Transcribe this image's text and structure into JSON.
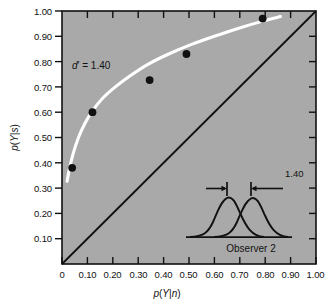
{
  "chart_data": {
    "type": "scatter",
    "title": "",
    "xlabel": "p(Y|n)",
    "ylabel": "p(Y|s)",
    "xlim": [
      0,
      1
    ],
    "ylim": [
      0,
      1
    ],
    "grid": false,
    "legend": "none",
    "xticklabels": [
      "0",
      "0.10",
      "0.20",
      "0.30",
      "0.40",
      "0.50",
      "0.60",
      "0.70",
      "0.80",
      "0.90",
      "1.00"
    ],
    "xtickvalues": [
      0,
      0.1,
      0.2,
      0.3,
      0.4,
      0.5,
      0.6,
      0.7,
      0.8,
      0.9,
      1.0
    ],
    "yticklabels": [
      "0.10",
      "0.20",
      "0.30",
      "0.40",
      "0.50",
      "0.60",
      "0.70",
      "0.80",
      "0.90",
      "1.00"
    ],
    "ytickvalues": [
      0.1,
      0.2,
      0.3,
      0.4,
      0.5,
      0.6,
      0.7,
      0.8,
      0.9,
      1.0
    ],
    "series": [
      {
        "name": "data-points",
        "marker": "filled-circle",
        "color": "#111111",
        "points": [
          {
            "x": 0.04,
            "y": 0.38
          },
          {
            "x": 0.12,
            "y": 0.6
          },
          {
            "x": 0.345,
            "y": 0.727
          },
          {
            "x": 0.49,
            "y": 0.83
          },
          {
            "x": 0.79,
            "y": 0.97
          }
        ]
      },
      {
        "name": "roc-curve",
        "marker": "line",
        "color": "#ffffff",
        "annotation": "d' = 1.40",
        "points": [
          {
            "x": 0.02,
            "y": 0.327
          },
          {
            "x": 0.03,
            "y": 0.38
          },
          {
            "x": 0.045,
            "y": 0.44
          },
          {
            "x": 0.065,
            "y": 0.5
          },
          {
            "x": 0.09,
            "y": 0.555
          },
          {
            "x": 0.12,
            "y": 0.605
          },
          {
            "x": 0.16,
            "y": 0.655
          },
          {
            "x": 0.21,
            "y": 0.7
          },
          {
            "x": 0.27,
            "y": 0.745
          },
          {
            "x": 0.34,
            "y": 0.79
          },
          {
            "x": 0.42,
            "y": 0.83
          },
          {
            "x": 0.51,
            "y": 0.868
          },
          {
            "x": 0.6,
            "y": 0.9
          },
          {
            "x": 0.69,
            "y": 0.93
          },
          {
            "x": 0.78,
            "y": 0.957
          },
          {
            "x": 0.86,
            "y": 0.978
          }
        ]
      },
      {
        "name": "chance-diagonal",
        "marker": "line",
        "color": "#111111",
        "points": [
          {
            "x": 0.0,
            "y": 0.0
          },
          {
            "x": 1.0,
            "y": 1.0
          }
        ]
      }
    ],
    "annotations": [
      {
        "name": "dprime-label",
        "text": "d′ = 1.40",
        "x": 0.08,
        "y": 0.795
      },
      {
        "name": "inset-separation-value",
        "text": "1.40"
      },
      {
        "name": "inset-caption",
        "text": "Observer 2"
      }
    ],
    "plot_background_color": "#a9a9a9",
    "curve_color": "#ffffff",
    "marker_color": "#111111",
    "axis_color": "#111111"
  },
  "axes": {
    "x_title_parts": {
      "p": "p(",
      "Y": "Y",
      "bar": "|",
      "n": "n",
      "close": ")"
    },
    "y_title_parts": {
      "p": "p(",
      "Y": "Y",
      "bar": "|",
      "s": "s",
      "close": ")"
    }
  },
  "inset": {
    "name": "signal-detection-distributions",
    "caption": "Observer 2",
    "separation_label": "1.40",
    "curve_count": 2
  }
}
